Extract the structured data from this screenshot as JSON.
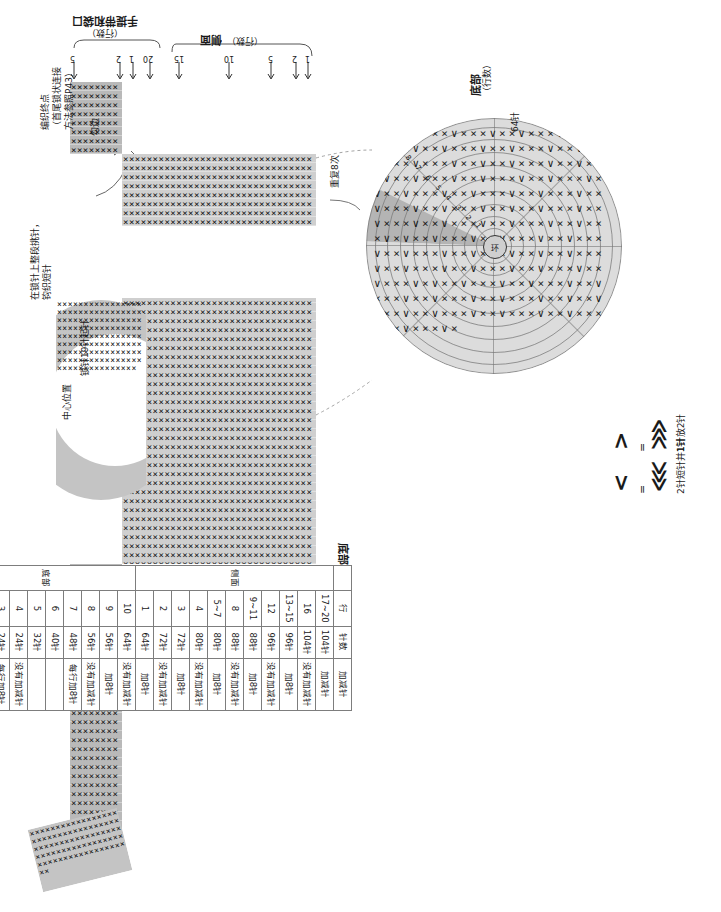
{
  "meta": {
    "language": "zh-CN"
  },
  "labels": {
    "handle_section": "手提带和袋口",
    "handle_section_unit": "（行数）",
    "side_section": "侧面",
    "side_section_unit": "（行数）",
    "bottom_section": "底部",
    "bottom_section_unit": "（行数）",
    "end_point": "编织终点",
    "end_point_note1": "（首尾锁状连接",
    "end_point_note2": "方法参照P43）",
    "edge_left": "勾边",
    "edge_left2": "勾边",
    "repeat": "重复8次",
    "pick_up": "在锁针上整段挑针，",
    "pick_up2": "钩织短针",
    "chain_start": "锁针19针起针",
    "center_pos": "中心位置",
    "stitch_count_64": "64针"
  },
  "ticks": {
    "handle": [
      "5",
      "2",
      "1",
      "20"
    ],
    "side": [
      "15",
      "10",
      "5",
      "2",
      "1"
    ]
  },
  "circle": {
    "center_label": "环",
    "round_numbers": [
      "1",
      "2",
      "3",
      "4",
      "5",
      "6",
      "7",
      "8",
      "9",
      "10"
    ]
  },
  "legend": {
    "title": "符号说明",
    "items": [
      {
        "symbol": ">",
        "equals": "=",
        "symbol2": "⋙",
        "text": "1针放2针",
        "name": "increase-symbol"
      },
      {
        "symbol": "<",
        "equals": "=",
        "symbol2": "⋘",
        "text": "2针短针并1针",
        "name": "decrease-symbol"
      }
    ]
  },
  "table": {
    "title": "底部和侧面的针数、加减针",
    "headers": [
      "",
      "行",
      "针数",
      "加减针"
    ],
    "sections": [
      {
        "name": "侧面",
        "rows": [
          {
            "row": "17~20",
            "stitches": "104针",
            "change": "加减针"
          },
          {
            "row": "16",
            "stitches": "104针",
            "change": "没有加减针"
          },
          {
            "row": "13~15",
            "stitches": "96针",
            "change": "加8针"
          },
          {
            "row": "12",
            "stitches": "96针",
            "change": "没有加减针"
          },
          {
            "row": "9~11",
            "stitches": "88针",
            "change": "加8针"
          },
          {
            "row": "8",
            "stitches": "88针",
            "change": "没有加减针"
          },
          {
            "row": "5~7",
            "stitches": "80针",
            "change": "加8针"
          },
          {
            "row": "4",
            "stitches": "80针",
            "change": "没有加减针"
          },
          {
            "row": "3",
            "stitches": "72针",
            "change": "加8针"
          },
          {
            "row": "2",
            "stitches": "72针",
            "change": "没有加减针"
          },
          {
            "row": "1",
            "stitches": "64针",
            "change": "加8针"
          }
        ]
      },
      {
        "name": "底部",
        "rows": [
          {
            "row": "10",
            "stitches": "64针",
            "change": "没有加减针"
          },
          {
            "row": "9",
            "stitches": "56针",
            "change": "加8针"
          },
          {
            "row": "8",
            "stitches": "56针",
            "change": "没有加减针"
          },
          {
            "row": "7",
            "stitches": "48针",
            "change": "每行加8针"
          },
          {
            "row": "6",
            "stitches": "40针",
            "change": ""
          },
          {
            "row": "5",
            "stitches": "32针",
            "change": ""
          },
          {
            "row": "4",
            "stitches": "24针",
            "change": "没有加减针"
          },
          {
            "row": "3",
            "stitches": "24针",
            "change": "每行加8针"
          },
          {
            "row": "2",
            "stitches": "16针",
            "change": ""
          },
          {
            "row": "1",
            "stitches": "8针",
            "change": "钩出8针"
          }
        ]
      }
    ]
  },
  "colors": {
    "fabric_light": "#dedede",
    "fabric_mid": "#cfcfcf",
    "fabric_dark": "#b5b5b5",
    "stroke": "#7d7d7d",
    "text": "#1a1a1a"
  }
}
